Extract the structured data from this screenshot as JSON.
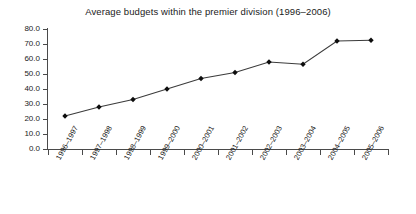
{
  "chart_data": {
    "type": "line",
    "title": "Average budgets within the premier division (1996–2006)",
    "xlabel": "",
    "ylabel": "",
    "categories": [
      "1996–1997",
      "1997–1998",
      "1998–1999",
      "1999–2000",
      "2000–2001",
      "2001–2002",
      "2002–2003",
      "2003–2004",
      "2004–2005",
      "2005–2006"
    ],
    "values": [
      22.0,
      28.0,
      33.0,
      40.0,
      47.0,
      51.0,
      58.0,
      56.5,
      72.0,
      72.5
    ],
    "ylim": [
      0.0,
      80.0
    ],
    "ytick_labels": [
      "0.0",
      "10.0",
      "20.0",
      "30.0",
      "40.0",
      "50.0",
      "60.0",
      "70.0",
      "80.0"
    ],
    "ytick_values": [
      0,
      10,
      20,
      30,
      40,
      50,
      60,
      70,
      80
    ],
    "grid": false,
    "legend": null,
    "marker": "diamond",
    "line_color": "#3b3b3b",
    "marker_color": "#0d0d0d",
    "axis_color": "#4a4a4a",
    "background_color": "#ffffff"
  }
}
